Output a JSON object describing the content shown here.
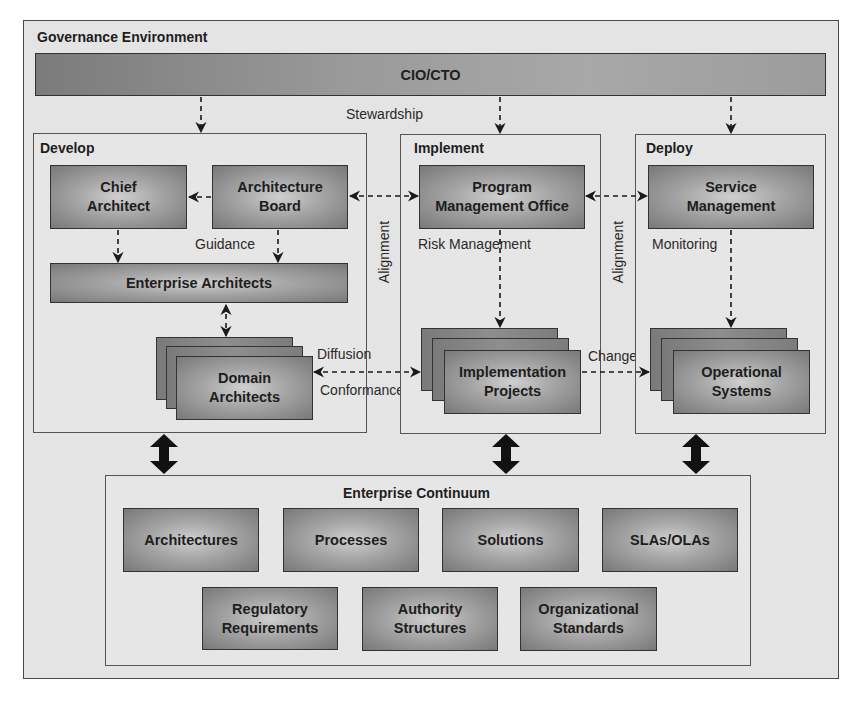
{
  "diagram": {
    "governance": {
      "title": "Governance Environment"
    },
    "cio": {
      "label": "CIO/CTO"
    },
    "stewardship_label": "Stewardship",
    "develop": {
      "title": "Develop",
      "chief_architect": "Chief Architect",
      "chief_architect_lines": [
        "Chief",
        "Architect"
      ],
      "architecture_board_lines": [
        "Architecture",
        "Board"
      ],
      "guidance_label": "Guidance",
      "enterprise_architects": "Enterprise Architects",
      "domain_architects_lines": [
        "Domain",
        "Architects"
      ]
    },
    "implement": {
      "title": "Implement",
      "pmo_lines": [
        "Program",
        "Management Office"
      ],
      "risk_label": "Risk Management",
      "projects_lines": [
        "Implementation",
        "Projects"
      ]
    },
    "deploy": {
      "title": "Deploy",
      "service_lines": [
        "Service",
        "Management"
      ],
      "monitoring_label": "Monitoring",
      "systems_lines": [
        "Operational",
        "Systems"
      ]
    },
    "alignment_label": "Alignment",
    "diffusion_label": "Diffusion",
    "conformance_label": "Conformance",
    "change_label": "Change",
    "continuum": {
      "title": "Enterprise Continuum",
      "row1": [
        "Architectures",
        "Processes",
        "Solutions",
        "SLAs/OLAs"
      ],
      "row2": [
        [
          "Regulatory",
          "Requirements"
        ],
        [
          "Authority",
          "Structures"
        ],
        [
          "Organizational",
          "Standards"
        ]
      ]
    }
  },
  "colors": {
    "frame_bg": "#e4e4e4",
    "box_dark": "#787878",
    "box_light": "#cfcfcf",
    "arrow": "#1a1a1a"
  }
}
